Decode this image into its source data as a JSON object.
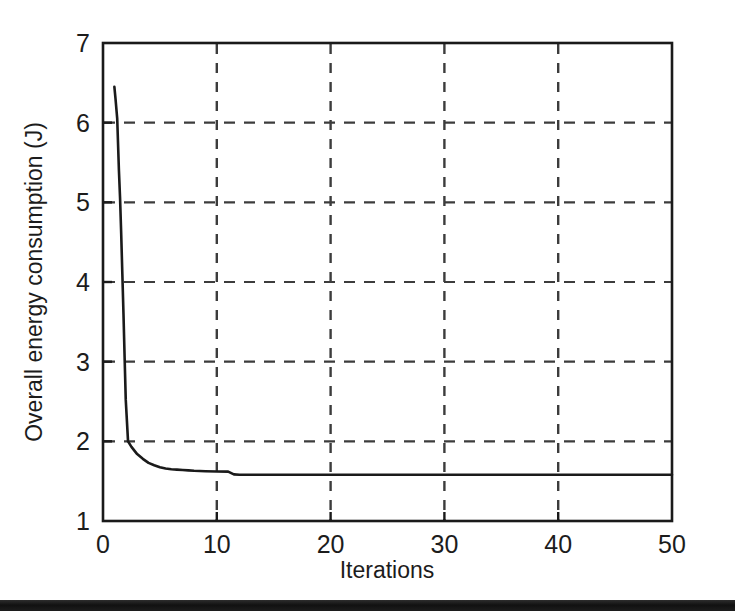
{
  "chart_data": {
    "type": "line",
    "title": "",
    "xlabel": "Iterations",
    "ylabel": "Overall energy consumption (J)",
    "xlim": [
      0,
      50
    ],
    "ylim": [
      1,
      7
    ],
    "xticks": [
      0,
      10,
      20,
      30,
      40,
      50
    ],
    "xtick_labels": [
      "0",
      "10",
      "20",
      "30",
      "40",
      "50"
    ],
    "yticks": [
      1,
      2,
      3,
      4,
      5,
      6,
      7
    ],
    "ytick_labels": [
      "1",
      "2",
      "3",
      "4",
      "5",
      "6",
      "7"
    ],
    "grid": true,
    "grid_style": "dashed",
    "legend": null,
    "line_color": "#1a1a1a",
    "series": [
      {
        "name": "Overall energy consumption",
        "x": [
          1,
          1.1,
          1.25,
          1.4,
          1.5,
          1.6,
          1.7,
          1.8,
          1.9,
          2,
          2.2,
          2.5,
          3,
          3.5,
          4,
          4.5,
          5,
          5.5,
          6,
          6.5,
          7,
          7.5,
          8,
          9,
          10,
          11,
          11.5,
          12,
          15,
          20,
          25,
          30,
          35,
          40,
          45,
          50
        ],
        "y": [
          6.45,
          6.3,
          6.05,
          5.4,
          5.05,
          4.6,
          4.1,
          3.6,
          3.05,
          2.52,
          2.0,
          1.93,
          1.84,
          1.78,
          1.73,
          1.7,
          1.675,
          1.66,
          1.65,
          1.645,
          1.64,
          1.635,
          1.63,
          1.625,
          1.622,
          1.62,
          1.585,
          1.58,
          1.58,
          1.58,
          1.58,
          1.58,
          1.58,
          1.58,
          1.58,
          1.58
        ]
      }
    ]
  },
  "figure": {
    "axis_color": "#1a1a1a",
    "grid_color": "#3c3c3c",
    "background": "#ffffff"
  }
}
